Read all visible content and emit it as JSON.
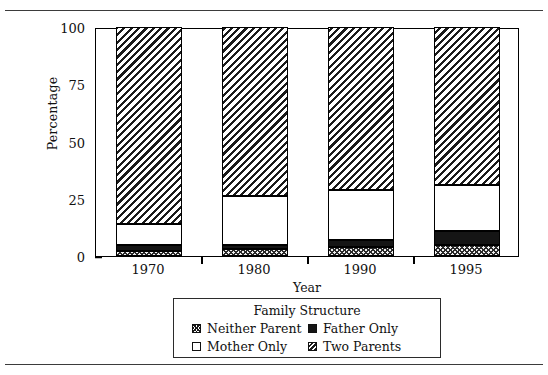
{
  "figure": {
    "clipped_caption": ""
  },
  "chart_data": {
    "type": "bar",
    "subtype": "stacked-percentage",
    "title": "",
    "xlabel": "Year",
    "ylabel": "Percentage",
    "categories": [
      "1970",
      "1980",
      "1990",
      "1995"
    ],
    "ylim": [
      0,
      100
    ],
    "yticks": [
      "0",
      "25",
      "50",
      "75",
      "100"
    ],
    "ytick_values": [
      0,
      25,
      50,
      75,
      100
    ],
    "grid": false,
    "legend_position": "below-axes",
    "legend_title": "Family Structure",
    "series": [
      {
        "name": "Neither Parent",
        "pattern": "crosshatch",
        "values": [
          2,
          3,
          4,
          5
        ]
      },
      {
        "name": "Father Only",
        "pattern": "solid-black",
        "values": [
          3,
          2,
          3,
          6
        ]
      },
      {
        "name": "Mother Only",
        "pattern": "white",
        "values": [
          9,
          21,
          22,
          20
        ]
      },
      {
        "name": "Two Parents",
        "pattern": "diagonal-hatch",
        "values": [
          86,
          74,
          71,
          69
        ]
      }
    ],
    "stack_order_bottom_to_top": [
      "Neither Parent",
      "Father Only",
      "Mother Only",
      "Two Parents"
    ]
  },
  "legend": {
    "title": "Family Structure",
    "items": [
      {
        "label": "Neither Parent"
      },
      {
        "label": "Father Only"
      },
      {
        "label": "Mother Only"
      },
      {
        "label": "Two Parents"
      }
    ]
  }
}
